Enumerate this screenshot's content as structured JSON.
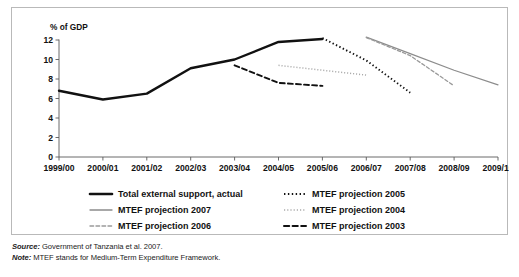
{
  "figure": {
    "source_label": "Source:",
    "source_text": " Government of Tanzania et al. 2007.",
    "note_label": "Note:",
    "note_text": " MTEF stands for Medium-Term Expenditure Framework."
  },
  "chart_data": {
    "type": "line",
    "title": "",
    "xlabel": "",
    "ylabel": "% of GDP",
    "ylim": [
      0,
      12
    ],
    "yticks": [
      0,
      2,
      4,
      6,
      8,
      10,
      12
    ],
    "ytick_labels": [
      "0",
      "2",
      "4",
      "6",
      "8",
      "10",
      "12"
    ],
    "grid": false,
    "legend_position": "bottom",
    "categories": [
      "1999/00",
      "2000/01",
      "2001/02",
      "2002/03",
      "2003/04",
      "2004/05",
      "2005/06",
      "2006/07",
      "2007/08",
      "2008/09",
      "2009/10"
    ],
    "series": [
      {
        "name": "Total external support, actual",
        "style": "solid",
        "color": "#111111",
        "width": 2.4,
        "x": [
          "1999/00",
          "2000/01",
          "2001/02",
          "2002/03",
          "2003/04",
          "2004/05",
          "2005/06"
        ],
        "values": [
          6.8,
          5.9,
          6.5,
          9.1,
          10.0,
          11.8,
          12.1
        ]
      },
      {
        "name": "MTEF projection 2007",
        "style": "solid",
        "color": "#8c8c8c",
        "width": 1.2,
        "x": [
          "2006/07",
          "2007/08",
          "2008/09",
          "2009/10"
        ],
        "values": [
          12.3,
          10.6,
          8.9,
          7.4
        ]
      },
      {
        "name": "MTEF projection 2006",
        "style": "dashed",
        "color": "#9a9a9a",
        "width": 1.3,
        "x": [
          "2006/07",
          "2007/08",
          "2008/09"
        ],
        "values": [
          12.25,
          10.4,
          7.3
        ]
      },
      {
        "name": "MTEF projection 2005",
        "style": "dotted",
        "color": "#111111",
        "width": 1.9,
        "x": [
          "2005/06",
          "2006/07",
          "2007/08"
        ],
        "values": [
          12.2,
          9.9,
          6.6
        ]
      },
      {
        "name": "MTEF projection 2004",
        "style": "dotted",
        "color": "#aaaaaa",
        "width": 1.5,
        "x": [
          "2004/05",
          "2005/06",
          "2006/07"
        ],
        "values": [
          9.4,
          8.9,
          8.4
        ]
      },
      {
        "name": "MTEF projection 2003",
        "style": "dashed",
        "color": "#111111",
        "width": 1.9,
        "x": [
          "2003/04",
          "2004/05",
          "2005/06"
        ],
        "values": [
          9.4,
          7.6,
          7.3
        ]
      }
    ],
    "legend": [
      {
        "label": "Total external support, actual",
        "style": "solid",
        "color": "#111111",
        "width": 2.6,
        "col": 0,
        "row": 0
      },
      {
        "label": "MTEF projection 2007",
        "style": "solid",
        "color": "#8c8c8c",
        "width": 1.3,
        "col": 0,
        "row": 1
      },
      {
        "label": "MTEF projection 2006",
        "style": "dashed",
        "color": "#9a9a9a",
        "width": 1.4,
        "col": 0,
        "row": 2
      },
      {
        "label": "MTEF projection 2005",
        "style": "dotted",
        "color": "#111111",
        "width": 2.0,
        "col": 1,
        "row": 0
      },
      {
        "label": "MTEF projection 2004",
        "style": "dotted",
        "color": "#aaaaaa",
        "width": 1.6,
        "col": 1,
        "row": 1
      },
      {
        "label": "MTEF projection 2003",
        "style": "dashed",
        "color": "#111111",
        "width": 2.0,
        "col": 1,
        "row": 2
      }
    ]
  }
}
